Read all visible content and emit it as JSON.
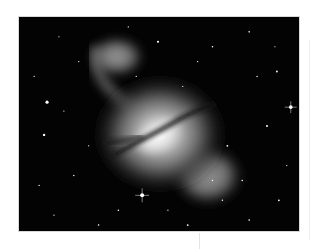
{
  "image": {
    "subject": "galaxy",
    "description": "Grayscale astronomical photograph of a galaxy with a dark dust lane crossing a bright core and two faint lobes, against a star field",
    "colors": {
      "background_page": "#ffffff",
      "sky": "#030303",
      "core": "#f2f2f2",
      "halo": "#8a8a8a",
      "dust_lane": "#1a1a1a"
    }
  }
}
